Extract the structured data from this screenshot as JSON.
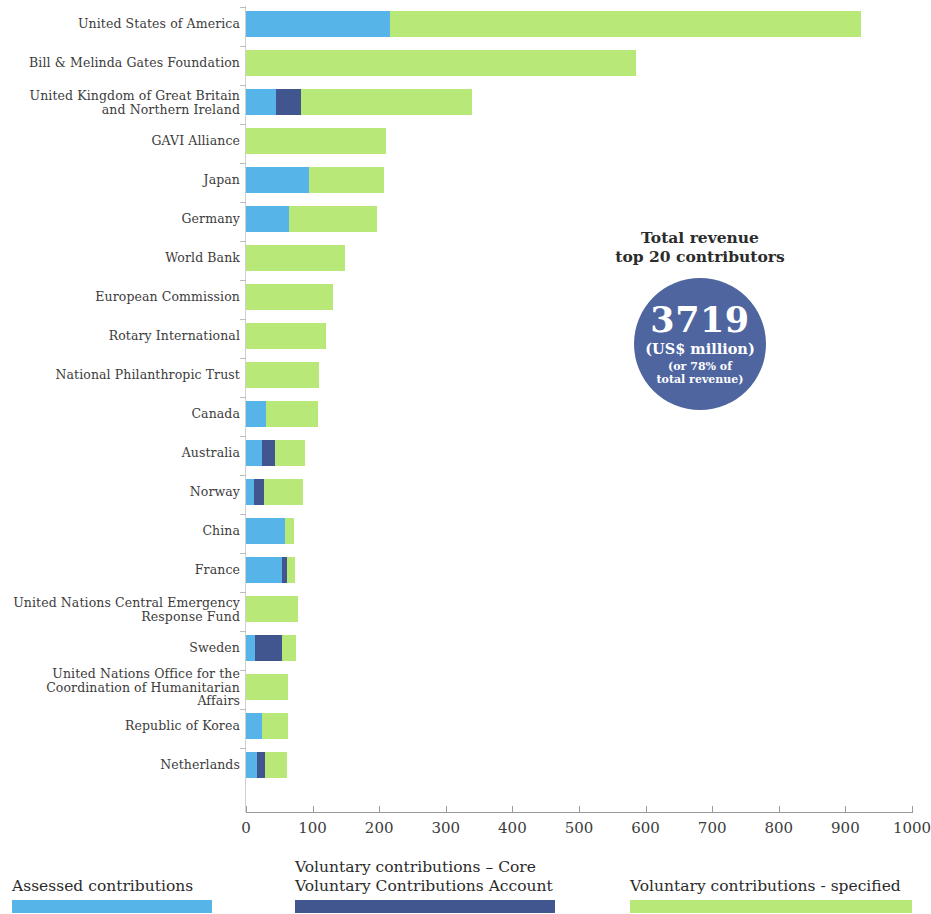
{
  "chart_data": {
    "type": "bar",
    "orientation": "horizontal",
    "stacked": true,
    "title": "",
    "xlabel": "",
    "ylabel": "",
    "xlim": [
      0,
      1000
    ],
    "xticks": [
      0,
      100,
      200,
      300,
      400,
      500,
      600,
      700,
      800,
      900,
      1000
    ],
    "xtick_labels": [
      "0",
      "100",
      "200",
      "300",
      "400",
      "500",
      "600",
      "700",
      "800",
      "900",
      "1000"
    ],
    "grid": false,
    "legend_position": "bottom",
    "categories": [
      "United States of America",
      "Bill & Melinda Gates Foundation",
      "United Kingdom of Great Britain\nand Northern Ireland",
      "GAVI Alliance",
      "Japan",
      "Germany",
      "World Bank",
      "European Commission",
      "Rotary International",
      "National Philanthropic Trust",
      "Canada",
      "Australia",
      "Norway",
      "China",
      "France",
      "United Nations Central Emergency\nResponse Fund",
      "Sweden",
      "United Nations Office for the\nCoordination of Humanitarian Affairs",
      "Republic of Korea",
      "Netherlands"
    ],
    "series": [
      {
        "name": "Assessed contributions",
        "color": "#56b4e8",
        "values": [
          216,
          0,
          45,
          0,
          94,
          64,
          0,
          0,
          0,
          0,
          30,
          24,
          12,
          59,
          54,
          0,
          13,
          0,
          24,
          17
        ]
      },
      {
        "name": "Voluntary contributions – Core\nVoluntary Contributions Account",
        "color": "#41558f",
        "values": [
          0,
          0,
          37,
          0,
          0,
          0,
          0,
          0,
          0,
          0,
          0,
          20,
          15,
          0,
          7,
          0,
          41,
          0,
          0,
          11
        ]
      },
      {
        "name": "Voluntary contributions - specified",
        "color": "#b8e877",
        "values": [
          708,
          586,
          257,
          210,
          113,
          133,
          148,
          130,
          120,
          109,
          78,
          45,
          58,
          13,
          12,
          78,
          21,
          63,
          39,
          33
        ]
      }
    ],
    "totals": [
      924,
      586,
      339,
      210,
      207,
      197,
      148,
      130,
      120,
      109,
      108,
      89,
      85,
      72,
      73,
      78,
      75,
      63,
      63,
      61
    ]
  },
  "callout": {
    "title": "Total revenue\ntop 20 contributors",
    "value": "3719",
    "unit": "(US$ million)",
    "sub": "(or 78% of\ntotal revenue)",
    "circle_color": "#4e659f"
  },
  "legend": {
    "items": [
      {
        "label": "Assessed contributions",
        "color": "#56b4e8"
      },
      {
        "label": "Voluntary contributions – Core\nVoluntary Contributions Account",
        "color": "#41558f"
      },
      {
        "label": "Voluntary contributions - specified",
        "color": "#b8e877"
      }
    ]
  }
}
